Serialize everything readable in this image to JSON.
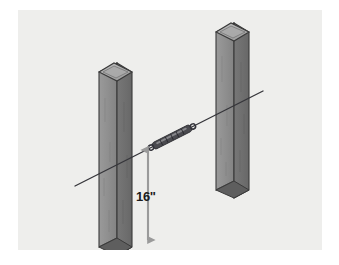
{
  "figure": {
    "name": "wood-post-spacing-diagram",
    "panel": {
      "background_color": "#eeeeec",
      "x": 18,
      "y": 10,
      "width": 304,
      "height": 240
    }
  },
  "dimension": {
    "label": "16\"",
    "value": 16,
    "unit": "inches",
    "arrow_color": "#9a9a9a",
    "text_color": "#1c1c1c",
    "orientation": "vertical",
    "arrow_top_y": 142,
    "arrow_bottom_y": 230
  },
  "posts": [
    {
      "name": "left-post",
      "label": "wood post left",
      "face_light_color": "#8e8e8e",
      "face_dark_color": "#6f6f6f",
      "top_color": "#b3b3b3",
      "outline_color": "#3a3a3a",
      "top_y": 62,
      "bottom_y": 246
    },
    {
      "name": "right-post",
      "label": "wood post right",
      "face_light_color": "#8e8e8e",
      "face_dark_color": "#6f6f6f",
      "top_color": "#b3b3b3",
      "outline_color": "#3a3a3a",
      "top_y": 22,
      "bottom_y": 188
    }
  ],
  "string_line": {
    "name": "mason-string-line",
    "color": "#35353a",
    "start_x": 75,
    "start_y": 186,
    "end_x": 263,
    "end_y": 91
  },
  "hardware": {
    "name": "line-tensioner",
    "label": "string line tensioner",
    "body_color": "#4a4a4f",
    "highlight_color": "#9b9b9e",
    "center_x": 172,
    "center_y": 137
  },
  "palette": {
    "page_background": "#ffffff",
    "panel_background": "#eeeeec",
    "post_light": "#8e8e8e",
    "post_dark": "#6f6f6f",
    "post_top": "#b3b3b3",
    "outline": "#3a3a3a",
    "line": "#35353a",
    "arrow": "#9a9a9a",
    "text": "#1c1c1c"
  }
}
